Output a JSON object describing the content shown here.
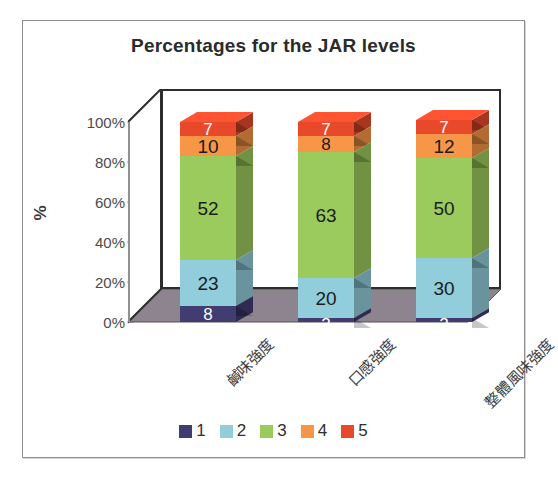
{
  "chart_data": {
    "type": "bar",
    "subtype": "stacked-100-percent-3d-column",
    "title": "Percentages for the JAR levels",
    "xlabel": "",
    "ylabel": "%",
    "ylim": [
      0,
      100
    ],
    "ytick_labels": [
      "100%",
      "80%",
      "60%",
      "40%",
      "20%",
      "0%"
    ],
    "ytick_values": [
      100,
      80,
      60,
      40,
      20,
      0
    ],
    "grid": false,
    "legend_position": "bottom",
    "legend_title": "",
    "categories": [
      "鹹味強度",
      "口感強度",
      "整體風味強度"
    ],
    "series": [
      {
        "name": "1",
        "color": "#413c72",
        "values": [
          8,
          2,
          2
        ]
      },
      {
        "name": "2",
        "color": "#92cddc",
        "values": [
          23,
          20,
          30
        ]
      },
      {
        "name": "3",
        "color": "#9bcb5c",
        "values": [
          52,
          63,
          50
        ]
      },
      {
        "name": "4",
        "color": "#f79646",
        "values": [
          10,
          8,
          12
        ]
      },
      {
        "name": "5",
        "color": "#e8492b",
        "values": [
          7,
          7,
          7
        ]
      }
    ],
    "data_labels": {
      "鹹味強度": [
        "8",
        "23",
        "52",
        "10",
        "7"
      ],
      "口感強度": [
        "2",
        "20",
        "63",
        "8",
        "7"
      ],
      "整體風味強度": [
        "2",
        "30",
        "50",
        "12",
        "7"
      ]
    },
    "colors": {
      "level1": "#413c72",
      "level2": "#92cddc",
      "level3": "#9bcb5c",
      "level4": "#f79646",
      "level5": "#e8492b",
      "floor": "#8e8490",
      "wall_outline": "#2d2d2d",
      "frame_border": "#8d8d8d",
      "title_color": "#2b2b2b"
    }
  },
  "legend": {
    "items": [
      {
        "label": "1",
        "color": "#413c72"
      },
      {
        "label": "2",
        "color": "#92cddc"
      },
      {
        "label": "3",
        "color": "#9bcb5c"
      },
      {
        "label": "4",
        "color": "#f79646"
      },
      {
        "label": "5",
        "color": "#e8492b"
      }
    ]
  }
}
